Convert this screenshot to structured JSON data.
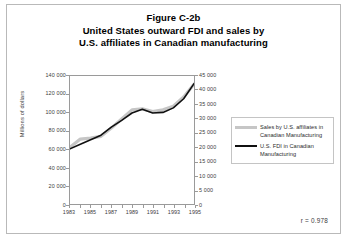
{
  "figure": {
    "title_lines": [
      "Figure C-2b",
      "United States outward FDI and sales by",
      "U.S. affiliates in Canadian manufacturing"
    ],
    "correlation_note": "r = 0.978"
  },
  "legend": {
    "entries": [
      {
        "label": "Sales by U.S. affiliates in Canadian Manufacturing",
        "color": "#c6c6c6",
        "axis": "left"
      },
      {
        "label": "U.S. FDI in Canadian Manufacturing",
        "color": "#101010",
        "axis": "right"
      }
    ]
  },
  "chart_data": {
    "type": "line",
    "title": "United States outward FDI and sales by U.S. affiliates in Canadian manufacturing",
    "xlabel": "",
    "ylabel": "Millions of dollars",
    "x": [
      1983,
      1984,
      1985,
      1986,
      1987,
      1988,
      1989,
      1990,
      1991,
      1992,
      1993,
      1994,
      1995
    ],
    "xlim": [
      1983,
      1995
    ],
    "xticks": [
      1983,
      1985,
      1987,
      1989,
      1991,
      1993,
      1995
    ],
    "xtick_labels": [
      "1983",
      "1985",
      "1987",
      "1989",
      "1991",
      "1993",
      "1995"
    ],
    "grid": false,
    "legend_position": "right",
    "axes": [
      {
        "side": "left",
        "label": "Millions of dollars",
        "ylim": [
          0,
          140000
        ],
        "yticks": [
          0,
          20000,
          40000,
          60000,
          80000,
          100000,
          120000,
          140000
        ],
        "ytick_labels": [
          "0",
          "20 000",
          "40 000",
          "60 000",
          "80 000",
          "100 000",
          "120 000",
          "140 000"
        ]
      },
      {
        "side": "right",
        "label": "",
        "ylim": [
          0,
          45000
        ],
        "yticks": [
          0,
          5000,
          10000,
          15000,
          20000,
          25000,
          30000,
          35000,
          40000,
          45000
        ],
        "ytick_labels": [
          "0",
          "5 000",
          "10 000",
          "15 000",
          "20 000",
          "25 000",
          "30 000",
          "35 000",
          "40 000",
          "45 000"
        ]
      }
    ],
    "series": [
      {
        "name": "Sales by U.S. affiliates in Canadian Manufacturing",
        "axis": "left",
        "color": "#c6c6c6",
        "values": [
          62000,
          71000,
          72000,
          74000,
          83000,
          93000,
          103000,
          104000,
          101000,
          103000,
          107000,
          117000,
          131000
        ]
      },
      {
        "name": "U.S. FDI in Canadian Manufacturing",
        "axis": "right",
        "color": "#101010",
        "values": [
          19400,
          21000,
          22600,
          24200,
          27000,
          29400,
          32000,
          33300,
          32000,
          32200,
          33800,
          37000,
          42300
        ]
      }
    ]
  }
}
